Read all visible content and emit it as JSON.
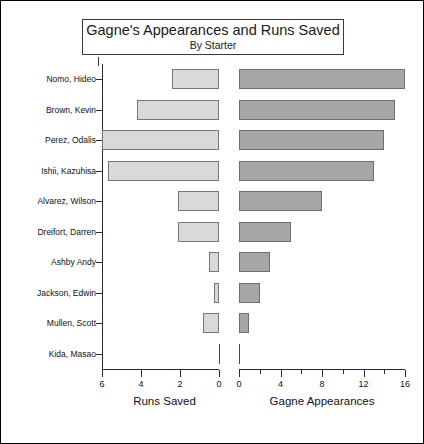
{
  "chart": {
    "title": "Gagne's Appearances and Runs Saved",
    "subtitle": "By Starter"
  },
  "chart_data": {
    "type": "bar",
    "orientation": "horizontal",
    "layout": "bidirectional-pyramid",
    "title": "Gagne's Appearances and Runs Saved",
    "subtitle": "By Starter",
    "categories": [
      "Nomo, Hideo",
      "Brown, Kevin",
      "Perez, Odalis",
      "Ishii, Kazuhisa",
      "Alvarez, Wilson",
      "Dreifort, Darren",
      "Ashby Andy",
      "Jackson, Edwin",
      "Mullen, Scott",
      "Kida, Masao"
    ],
    "series": [
      {
        "name": "Runs Saved",
        "side": "left",
        "color": "#d9d9d9",
        "values": [
          2.4,
          4.2,
          6.0,
          5.7,
          2.1,
          2.1,
          0.5,
          0.25,
          0.8,
          0
        ],
        "axis": {
          "label": "Runs Saved",
          "ticks": [
            6,
            4,
            2,
            0
          ],
          "min": 0,
          "max": 6,
          "direction": "reversed"
        }
      },
      {
        "name": "Gagne Appearances",
        "side": "right",
        "color": "#a6a6a6",
        "values": [
          16,
          15,
          14,
          13,
          8,
          5,
          3,
          2,
          1,
          0
        ],
        "axis": {
          "label": "Gagne Appearances",
          "ticks": [
            0,
            2,
            4,
            6,
            8,
            10,
            12,
            14,
            16
          ],
          "major_ticks": [
            0,
            4,
            8,
            12,
            16
          ],
          "minor_ticks": [
            2,
            6,
            10,
            14
          ],
          "min": 0,
          "max": 16,
          "direction": "normal"
        }
      }
    ],
    "grid": false,
    "legend": "none"
  }
}
